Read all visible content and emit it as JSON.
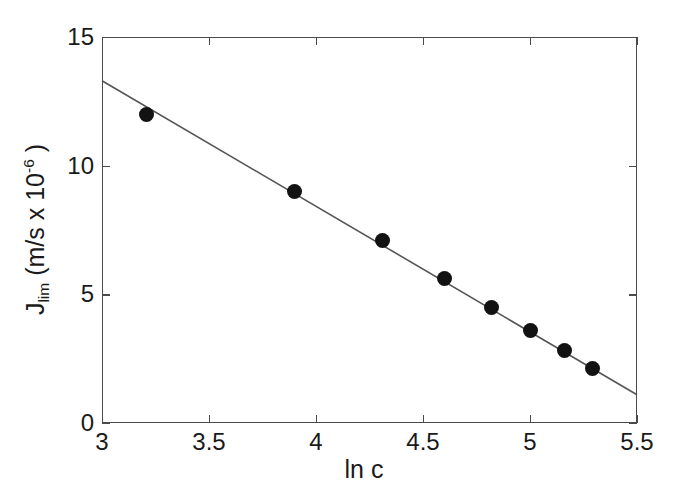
{
  "chart_data": {
    "type": "scatter",
    "title": "",
    "xlabel": "ln c",
    "ylabel": "J_lim (m/s x 10^-6 )",
    "ylabel_base": "J",
    "ylabel_sub": "lim",
    "ylabel_mid": " (m/s x 10",
    "ylabel_sup": "-6",
    "ylabel_tail": " )",
    "xlim": [
      3,
      5.5
    ],
    "ylim": [
      0,
      15
    ],
    "xticks": [
      3,
      3.5,
      4,
      4.5,
      5,
      5.5
    ],
    "xticklabels": [
      "3",
      "3.5",
      "4",
      "4.5",
      "5",
      "5.5"
    ],
    "yticks": [
      0,
      5,
      10,
      15
    ],
    "yticklabels": [
      "0",
      "5",
      "10",
      "15"
    ],
    "grid": false,
    "legend": false,
    "marker": "filled-circle",
    "marker_color": "#121212",
    "line_color": "#555555",
    "axis_color": "#4a4a4a",
    "background": "#ffffff",
    "x": [
      3.21,
      3.9,
      4.31,
      4.6,
      4.82,
      5.0,
      5.16,
      5.29
    ],
    "y": [
      12.0,
      9.0,
      7.1,
      5.6,
      4.5,
      3.6,
      2.8,
      2.1
    ],
    "series": [
      {
        "name": "J_lim data",
        "x": [
          3.21,
          3.9,
          4.31,
          4.6,
          4.82,
          5.0,
          5.16,
          5.29
        ],
        "values": [
          12.0,
          9.0,
          7.1,
          5.6,
          4.5,
          3.6,
          2.8,
          2.1
        ]
      }
    ],
    "fit_line": {
      "name": "linear fit",
      "x_start": 3.0,
      "y_start": 13.3,
      "x_end": 5.5,
      "y_end": 1.1,
      "slope": -4.88,
      "intercept": 27.94
    }
  }
}
